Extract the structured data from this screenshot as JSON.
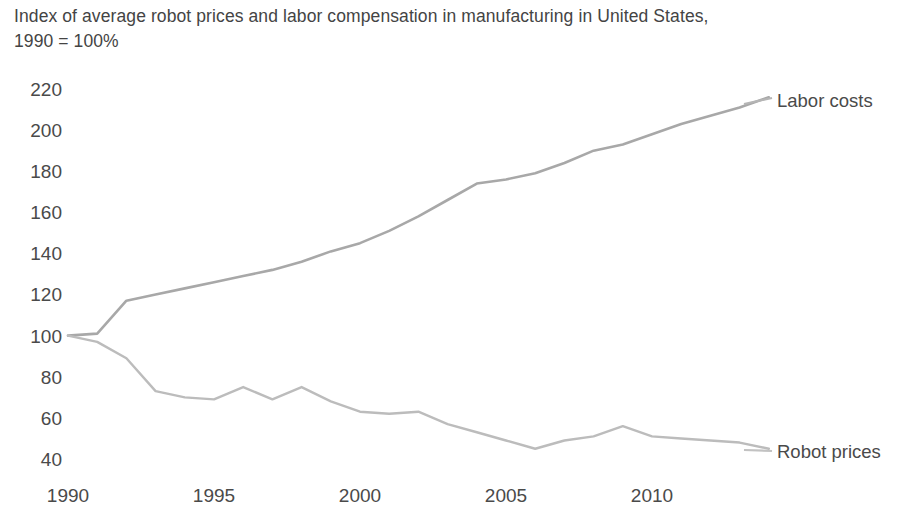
{
  "chart_data": {
    "type": "line",
    "title": "Index of average robot prices and labor compensation in manufacturing in United States,\n1990 = 100%",
    "xlabel": "",
    "ylabel": "",
    "xlim": [
      1990,
      2014
    ],
    "ylim": [
      40,
      220
    ],
    "y_ticks": [
      220,
      200,
      180,
      160,
      140,
      120,
      100,
      80,
      60,
      40
    ],
    "x_ticks": [
      1990,
      1995,
      2000,
      2005,
      2010
    ],
    "grid": false,
    "legend_position": "right-inline-labels",
    "x": [
      1990,
      1991,
      1992,
      1993,
      1994,
      1995,
      1996,
      1997,
      1998,
      1999,
      2000,
      2001,
      2002,
      2003,
      2004,
      2005,
      2006,
      2007,
      2008,
      2009,
      2010,
      2011,
      2012,
      2013,
      2014
    ],
    "series": [
      {
        "name": "Labor costs",
        "color": "#a8a8a8",
        "values": [
          100,
          101,
          117,
          120,
          123,
          126,
          129,
          132,
          136,
          141,
          145,
          151,
          158,
          166,
          174,
          176,
          179,
          184,
          190,
          193,
          198,
          203,
          207,
          211,
          216
        ]
      },
      {
        "name": "Robot prices",
        "color": "#bcbcbc",
        "values": [
          100,
          97,
          89,
          73,
          70,
          69,
          75,
          69,
          75,
          68,
          63,
          62,
          63,
          57,
          53,
          49,
          45,
          49,
          51,
          56,
          51,
          50,
          49,
          48,
          45
        ]
      }
    ]
  },
  "labels": {
    "labor_costs": "Labor costs",
    "robot_prices": "Robot prices"
  },
  "axis": {
    "y_tick_labels": [
      "220",
      "200",
      "180",
      "160",
      "140",
      "120",
      "100",
      "80",
      "60",
      "40"
    ],
    "x_tick_labels": [
      "1990",
      "1995",
      "2000",
      "2005",
      "2010"
    ]
  }
}
